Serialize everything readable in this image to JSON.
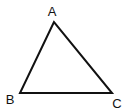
{
  "diagram": {
    "type": "triangle",
    "stroke_color": "#111111",
    "stroke_width": 2,
    "background": "#ffffff",
    "vertices": [
      {
        "label": "A",
        "x": 54,
        "y": 22,
        "label_x": 52,
        "label_y": 16
      },
      {
        "label": "B",
        "x": 20,
        "y": 93,
        "label_x": 10,
        "label_y": 104
      },
      {
        "label": "C",
        "x": 112,
        "y": 93,
        "label_x": 117,
        "label_y": 108
      }
    ]
  }
}
